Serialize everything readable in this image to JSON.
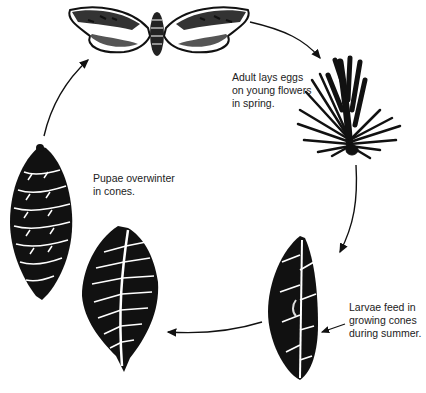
{
  "diagram": {
    "type": "life-cycle",
    "stages": [
      {
        "id": "adult",
        "label": "Adult lays eggs\non young flowers\nin spring.",
        "icon": "moth-icon"
      },
      {
        "id": "larvae",
        "label": "Larvae feed in\ngrowing cones\nduring summer.",
        "icon": "infested-cone-icon"
      },
      {
        "id": "pupae",
        "label": "Pupae overwinter\nin cones.",
        "icon": "cone-cross-section-icon"
      }
    ],
    "illustrations": [
      "moth",
      "pine-flower-shoot",
      "larva-infested-cone",
      "cone-cross-section",
      "mature-cone"
    ],
    "colors": {
      "ink": "#111111",
      "background": "#ffffff"
    }
  }
}
